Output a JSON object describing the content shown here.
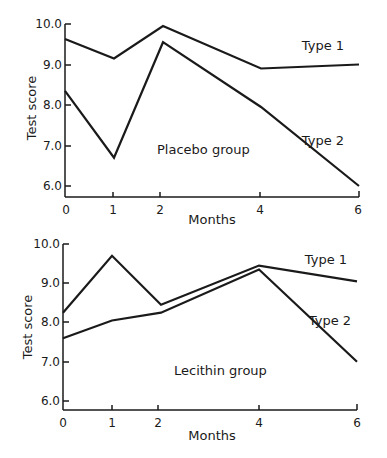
{
  "chart_data": [
    {
      "type": "line",
      "title": "Placebo group",
      "xlabel": "Months",
      "ylabel": "Test score",
      "x": [
        0,
        1,
        2,
        4,
        6
      ],
      "x_tick_labels": [
        "0",
        "1",
        "2",
        "4",
        "6"
      ],
      "y_tick_labels": [
        "6.0",
        "7.0",
        "8.0",
        "9.0",
        "10.0"
      ],
      "ylim": [
        5.75,
        10.0
      ],
      "grid": false,
      "legend": "inline labels at right end of lines",
      "series": [
        {
          "name": "Type 1",
          "values": [
            9.63,
            9.15,
            9.95,
            8.9,
            9.0
          ]
        },
        {
          "name": "Type 2",
          "values": [
            8.35,
            6.7,
            9.55,
            7.95,
            6.0
          ]
        }
      ],
      "annotation": "Placebo group"
    },
    {
      "type": "line",
      "title": "Lecithin group",
      "xlabel": "Months",
      "ylabel": "Test score",
      "x": [
        0,
        1,
        2,
        4,
        6
      ],
      "x_tick_labels": [
        "0",
        "1",
        "2",
        "4",
        "6"
      ],
      "y_tick_labels": [
        "6.0",
        "7.0",
        "8.0",
        "9.0",
        "10.0"
      ],
      "ylim": [
        5.75,
        10.0
      ],
      "grid": false,
      "legend": "inline labels at right end of lines",
      "series": [
        {
          "name": "Type 1",
          "values": [
            8.25,
            9.7,
            8.45,
            9.45,
            9.05
          ]
        },
        {
          "name": "Type 2",
          "values": [
            7.6,
            8.05,
            8.25,
            9.35,
            7.0
          ]
        }
      ],
      "annotation": "Lecithin group"
    }
  ],
  "top": {
    "ylabel": "Test score",
    "xlabel": "Months",
    "annotation": "Placebo group",
    "series_labels": [
      "Type 1",
      "Type 2"
    ],
    "xticks": [
      "0",
      "1",
      "2",
      "4",
      "6"
    ],
    "yticks": [
      "10.0",
      "9.0",
      "8.0",
      "7.0",
      "6.0"
    ]
  },
  "bottom": {
    "ylabel": "Test score",
    "xlabel": "Months",
    "annotation": "Lecithin group",
    "series_labels": [
      "Type 1",
      "Type 2"
    ],
    "xticks": [
      "0",
      "1",
      "2",
      "4",
      "6"
    ],
    "yticks": [
      "10.0",
      "9.0",
      "8.0",
      "7.0",
      "6.0"
    ]
  }
}
